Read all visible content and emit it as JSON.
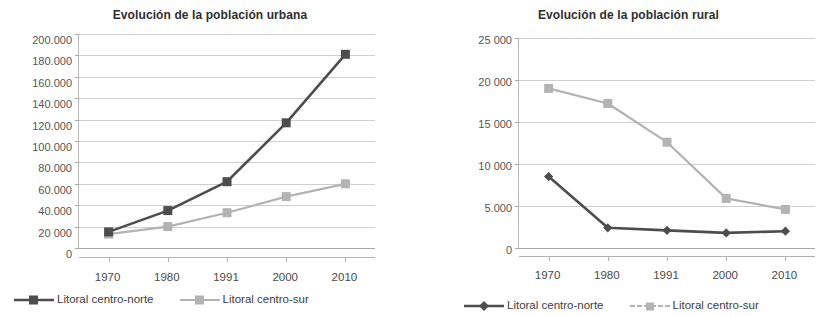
{
  "colors": {
    "series_norte": "#4d4d4d",
    "series_sur": "#b3b3b3",
    "grid": "#cfcfcf",
    "axis": "#a8a8a8",
    "text": "#3a3a3a",
    "background": "#ffffff"
  },
  "legend": {
    "norte_label": "Litoral centro-norte",
    "sur_label": "Litoral centro-sur"
  },
  "chart_data": [
    {
      "type": "line",
      "id": "urban",
      "title": "Evolución de la población urbana",
      "xlabel": "",
      "ylabel": "",
      "categories": [
        "1970",
        "1980",
        "1991",
        "2000",
        "2010"
      ],
      "ylim": [
        0,
        200000
      ],
      "ytick_step": 20000,
      "ytick_labels": [
        "200.000",
        "180.000",
        "160.000",
        "140.000",
        "120.000",
        "100.000",
        "80.000",
        "60.000",
        "40.000",
        "20 000",
        "0"
      ],
      "ytick_values": [
        200000,
        180000,
        160000,
        140000,
        120000,
        100000,
        80000,
        60000,
        40000,
        20000,
        0
      ],
      "grid": true,
      "legend_position": "bottom",
      "marker": "square",
      "series": [
        {
          "name": "Litoral centro-norte",
          "color": "#4d4d4d",
          "marker": "square",
          "values": [
            15000,
            35000,
            62000,
            117000,
            181000
          ]
        },
        {
          "name": "Litoral centro-sur",
          "color": "#b3b3b3",
          "marker": "square",
          "values": [
            13000,
            20000,
            33000,
            48000,
            60000
          ]
        }
      ]
    },
    {
      "type": "line",
      "id": "rural",
      "title": "Evolución de la población rural",
      "xlabel": "",
      "ylabel": "",
      "categories": [
        "1970",
        "1980",
        "1991",
        "2000",
        "2010"
      ],
      "ylim": [
        0,
        25000
      ],
      "ytick_step": 5000,
      "ytick_labels": [
        "25 000",
        "20 000",
        "15 000",
        "10 000",
        "5.000",
        "0"
      ],
      "ytick_values": [
        25000,
        20000,
        15000,
        10000,
        5000,
        0
      ],
      "grid": true,
      "legend_position": "bottom",
      "marker": "diamond",
      "series": [
        {
          "name": "Litoral centro-norte",
          "color": "#4d4d4d",
          "marker": "diamond",
          "values": [
            8500,
            2400,
            2100,
            1800,
            2000
          ]
        },
        {
          "name": "Litoral centro-sur",
          "color": "#b3b3b3",
          "marker": "square",
          "values": [
            19000,
            17200,
            12600,
            5900,
            4600
          ]
        }
      ]
    }
  ]
}
